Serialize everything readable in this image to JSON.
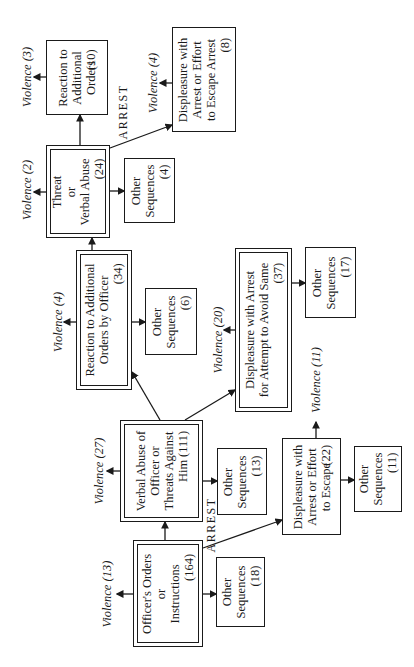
{
  "diagram": {
    "type": "flowchart",
    "orientation": "rotated-90-ccw",
    "arrest_label": "ARREST",
    "nodes": {
      "officers_orders": {
        "lines": [
          "Officer's Orders",
          "or",
          "Instructions"
        ],
        "count": "(164)",
        "violence": "Violence (13)",
        "other": {
          "lines": [
            "Other",
            "Sequences"
          ],
          "count": "(18)"
        }
      },
      "verbal_abuse_officer": {
        "lines": [
          "Verbal Abuse of",
          "Officer or",
          "Threats Against",
          "Him"
        ],
        "count": "(111)",
        "violence": "Violence (27)",
        "other": {
          "lines": [
            "Other",
            "Sequences"
          ],
          "count": "(13)"
        }
      },
      "displeasure_escape": {
        "lines": [
          "Displeasure with",
          "Arrest or Effort",
          "to Escape"
        ],
        "count": "(22)",
        "violence": "Violence (11)",
        "other": {
          "lines": [
            "Other",
            "Sequences"
          ],
          "count": "(11)"
        }
      },
      "reaction_orders_officer": {
        "lines": [
          "Reaction to Additional",
          "Orders by Officer"
        ],
        "count": "(34)",
        "violence": "Violence (4)",
        "other": {
          "lines": [
            "Other",
            "Sequences"
          ],
          "count": "(6)"
        }
      },
      "displeasure_avoid": {
        "lines": [
          "Displeasure with Arrest",
          "for Attempt to Avoid Same"
        ],
        "count": "(37)",
        "violence": "Violence (20)",
        "other": {
          "lines": [
            "Other",
            "Sequences"
          ],
          "count": "(17)"
        }
      },
      "threat_verbal": {
        "lines": [
          "Threat",
          "or",
          "Verbal Abuse"
        ],
        "count": "(24)",
        "violence": "Violence (2)",
        "other": {
          "lines": [
            "Other",
            "Sequences"
          ],
          "count": "(4)"
        }
      },
      "reaction_additional": {
        "lines": [
          "Reaction to",
          "Additional",
          "Orders"
        ],
        "count": "(10)",
        "violence": "Violence (3)"
      },
      "displeasure_escape_arrest": {
        "lines": [
          "Displeasure with",
          "Arrest or Effort",
          "to Escape Arrest"
        ],
        "count": "(8)",
        "violence": "Violence (4)"
      }
    }
  }
}
